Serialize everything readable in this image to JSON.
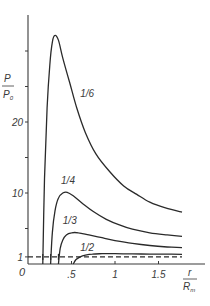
{
  "chart_data": {
    "type": "line",
    "title": "",
    "xlabel": {
      "num": "r",
      "den": "R_m",
      "den_main": "R",
      "den_sub": "m"
    },
    "ylabel": {
      "num": "P",
      "den": "P_0",
      "den_main": "P",
      "den_sub": "0"
    },
    "xlim": [
      0,
      1.85
    ],
    "ylim": [
      0,
      33
    ],
    "grid": false,
    "legend": "inline labels",
    "x_ticks": [
      {
        "value": 0,
        "label": "0"
      },
      {
        "value": 0.5,
        "label": ".5"
      },
      {
        "value": 1.0,
        "label": "1"
      },
      {
        "value": 1.5,
        "label": "1.5"
      }
    ],
    "y_ticks": [
      {
        "value": 0,
        "label": "0"
      },
      {
        "value": 1,
        "label": "1"
      },
      {
        "value": 5,
        "label": ""
      },
      {
        "value": 10,
        "label": "10"
      },
      {
        "value": 15,
        "label": ""
      },
      {
        "value": 20,
        "label": "20"
      },
      {
        "value": 25,
        "label": ""
      },
      {
        "value": 30,
        "label": ""
      }
    ],
    "reference_line": {
      "type": "dashed",
      "y": 1,
      "x_range": [
        0,
        1.77
      ]
    },
    "series": [
      {
        "name": "1/6",
        "label_pos": {
          "x": 0.6,
          "y": 23.5
        },
        "start_r": 0.17,
        "x": [
          0.17,
          0.19,
          0.22,
          0.25,
          0.28,
          0.31,
          0.35,
          0.4,
          0.48,
          0.56,
          0.66,
          0.78,
          0.94,
          1.1,
          1.25,
          1.4,
          1.58,
          1.77
        ],
        "y": [
          0,
          12,
          22,
          28,
          31.3,
          32.2,
          31.5,
          29,
          25.5,
          22,
          18.5,
          15.5,
          13,
          11,
          9.8,
          8.7,
          7.9,
          7.3
        ]
      },
      {
        "name": "1/4",
        "label_pos": {
          "x": 0.38,
          "y": 11.2
        },
        "start_r": 0.26,
        "x": [
          0.26,
          0.28,
          0.31,
          0.35,
          0.4,
          0.45,
          0.52,
          0.62,
          0.75,
          0.9,
          1.05,
          1.2,
          1.4,
          1.6,
          1.77
        ],
        "y": [
          0,
          4.5,
          7.5,
          9.3,
          10.0,
          10.1,
          9.6,
          8.6,
          7.4,
          6.3,
          5.5,
          4.9,
          4.4,
          4.1,
          3.9
        ]
      },
      {
        "name": "1/3",
        "label_pos": {
          "x": 0.4,
          "y": 5.6
        },
        "start_r": 0.35,
        "x": [
          0.35,
          0.37,
          0.4,
          0.44,
          0.5,
          0.58,
          0.7,
          0.85,
          1.0,
          1.2,
          1.4,
          1.6,
          1.77
        ],
        "y": [
          0,
          2.2,
          3.4,
          4.1,
          4.4,
          4.4,
          4.1,
          3.7,
          3.3,
          2.9,
          2.6,
          2.4,
          2.3
        ]
      },
      {
        "name": "1/2",
        "label_pos": {
          "x": 0.6,
          "y": 1.9
        },
        "start_r": 0.52,
        "x": [
          0.52,
          0.55,
          0.6,
          0.66,
          0.74,
          0.85,
          1.0,
          1.2,
          1.4,
          1.6,
          1.77
        ],
        "y": [
          0,
          0.6,
          1.0,
          1.25,
          1.4,
          1.45,
          1.45,
          1.42,
          1.4,
          1.38,
          1.37
        ]
      }
    ]
  },
  "colors": {
    "line": "#2a2a2a",
    "axis": "#3a3a3a",
    "text": "#3a3a3a",
    "background": "#ffffff"
  }
}
